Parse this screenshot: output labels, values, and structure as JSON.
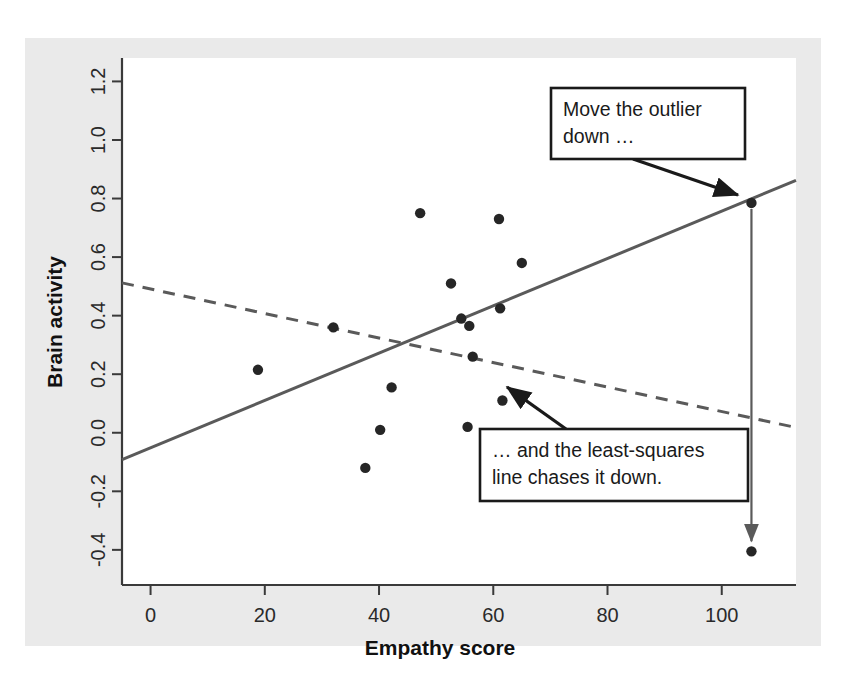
{
  "figure": {
    "background_color": "#ffffff",
    "plate_color": "#eaeaea",
    "panel_color": "#ffffff",
    "axis_color": "#3a3a3a",
    "point_color": "#262626",
    "line_color": "#5a5a5a",
    "annotation_color": "#1a1a1a"
  },
  "chart_data": {
    "type": "scatter",
    "title": "",
    "xlabel": "Empathy score",
    "ylabel": "Brain activity",
    "xlim": [
      -5,
      113
    ],
    "ylim": [
      -0.52,
      1.28
    ],
    "xticks": [
      0,
      20,
      40,
      60,
      80,
      100
    ],
    "xticklabels": [
      "0",
      "20",
      "40",
      "60",
      "80",
      "100"
    ],
    "yticks": [
      -0.4,
      -0.2,
      0.0,
      0.2,
      0.4,
      0.6,
      0.8,
      1.0,
      1.2
    ],
    "yticklabels": [
      "-0.4",
      "-0.2",
      "0.0",
      "0.2",
      "0.4",
      "0.6",
      "0.8",
      "1.0",
      "1.2"
    ],
    "grid": false,
    "legend": "none",
    "points": [
      {
        "x": 18.8,
        "y": 0.215
      },
      {
        "x": 32.0,
        "y": 0.36
      },
      {
        "x": 37.6,
        "y": -0.12
      },
      {
        "x": 40.2,
        "y": 0.01
      },
      {
        "x": 42.2,
        "y": 0.155
      },
      {
        "x": 47.2,
        "y": 0.75
      },
      {
        "x": 52.6,
        "y": 0.51
      },
      {
        "x": 54.4,
        "y": 0.39
      },
      {
        "x": 55.8,
        "y": 0.365
      },
      {
        "x": 55.5,
        "y": 0.02
      },
      {
        "x": 56.4,
        "y": 0.26
      },
      {
        "x": 61.0,
        "y": 0.73
      },
      {
        "x": 61.2,
        "y": 0.425
      },
      {
        "x": 61.6,
        "y": 0.11
      },
      {
        "x": 65.0,
        "y": 0.58
      },
      {
        "x": 105.2,
        "y": 0.785
      },
      {
        "x": 105.2,
        "y": -0.405
      }
    ],
    "series": [
      {
        "name": "least-squares line with outlier high",
        "style": "solid",
        "x": [
          -5,
          113
        ],
        "y": [
          -0.092,
          0.862
        ]
      },
      {
        "name": "least-squares line after outlier moved down",
        "style": "dashed",
        "x": [
          -5,
          113
        ],
        "y": [
          0.512,
          0.018
        ]
      }
    ],
    "annotations": [
      {
        "id": "move-outlier",
        "text_lines": [
          "Move the outlier",
          "down …"
        ],
        "box": {
          "x": 551,
          "y": 88,
          "width": 194,
          "height": 71
        },
        "arrow": {
          "x1": 633,
          "y1": 159,
          "x2": 738,
          "y2": 195
        }
      },
      {
        "id": "line-chases",
        "text_lines": [
          "… and the least-squares",
          "line chases it down."
        ],
        "box": {
          "x": 480,
          "y": 429,
          "width": 268,
          "height": 72
        },
        "arrow": {
          "x1": 566,
          "y1": 429,
          "x2": 507,
          "y2": 387
        }
      }
    ],
    "outlier_move_arrow": {
      "from": {
        "x": 105.2,
        "y": 0.785
      },
      "to": {
        "x": 105.2,
        "y": -0.405
      }
    }
  }
}
